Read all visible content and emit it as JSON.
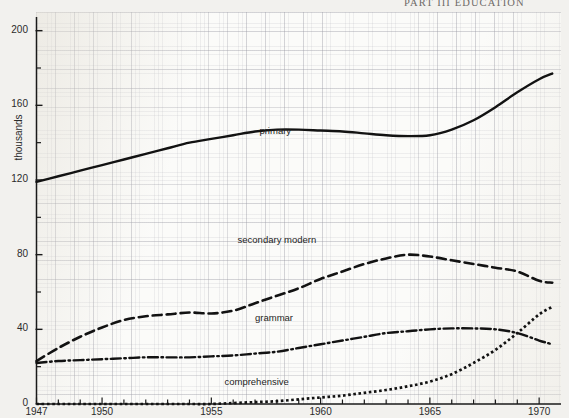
{
  "header": {
    "title": "PART III  EDUCATION"
  },
  "chart_data": {
    "type": "line",
    "title": "",
    "subtitle": "",
    "xlabel": "",
    "ylabel": "thousands",
    "yunit_label": "thousands",
    "xlim": [
      1947,
      1971
    ],
    "ylim": [
      0,
      210
    ],
    "ytick_values": [
      0,
      40,
      80,
      120,
      160,
      200
    ],
    "ytick_labels": [
      "0",
      "40",
      "80",
      "120",
      "160",
      "200"
    ],
    "yminor_values": [
      20,
      60,
      100,
      140,
      180
    ],
    "xtick_labels": [
      "1947",
      "1950",
      "1955",
      "1960",
      "1965",
      "1970"
    ],
    "xtick_values": [
      1947,
      1950,
      1955,
      1960,
      1965,
      1970
    ],
    "grid": "graph-paper",
    "legend": "inline-labels",
    "x": [
      1947,
      1948,
      1949,
      1950,
      1951,
      1952,
      1953,
      1954,
      1955,
      1956,
      1957,
      1958,
      1959,
      1960,
      1961,
      1962,
      1963,
      1964,
      1965,
      1966,
      1967,
      1968,
      1969,
      1970,
      1970.6
    ],
    "series": [
      {
        "name": "primary",
        "label": "primary",
        "style": "solid",
        "color": "#121212",
        "label_x": 1957.2,
        "label_y": 146,
        "values": [
          119,
          122,
          125,
          128,
          131,
          134,
          137,
          140,
          142,
          144,
          146,
          147,
          147,
          146.5,
          146,
          145,
          144,
          143.5,
          144,
          147,
          152,
          159,
          167,
          174,
          177
        ]
      },
      {
        "name": "secondary modern",
        "label": "secondary  modern",
        "style": "dashed",
        "color": "#121212",
        "label_x": 1956.2,
        "label_y": 88,
        "values": [
          23,
          30,
          36,
          41,
          45,
          47,
          48,
          49,
          48.5,
          50,
          54,
          58,
          62,
          67,
          71,
          75,
          78,
          80,
          79,
          77,
          75,
          73,
          71,
          66,
          65
        ]
      },
      {
        "name": "grammar",
        "label": "grammar",
        "style": "dashdot",
        "color": "#121212",
        "label_x": 1957.0,
        "label_y": 46,
        "values": [
          22,
          23,
          23.5,
          24,
          24.5,
          25,
          25,
          25,
          25.5,
          26,
          27,
          28,
          30,
          32,
          34,
          36,
          38,
          39,
          40,
          40.5,
          40.5,
          40,
          38,
          34,
          32
        ]
      },
      {
        "name": "comprehensive",
        "label": "comprehensive",
        "style": "dotted",
        "color": "#121212",
        "label_x": 1955.6,
        "label_y": 12,
        "values": [
          0,
          0,
          0,
          0,
          0,
          0,
          0,
          0,
          0,
          0.5,
          1,
          1.5,
          2.5,
          3.5,
          4.5,
          6,
          7.5,
          9.5,
          12,
          16,
          22,
          29,
          38,
          48,
          52
        ]
      }
    ]
  }
}
